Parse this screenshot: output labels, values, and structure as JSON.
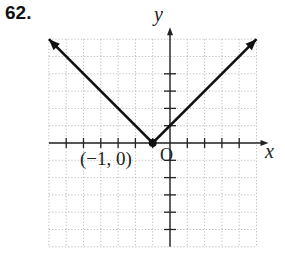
{
  "problem_number": "62.",
  "chart_data": {
    "type": "line",
    "title": "",
    "function_description": "y = |x + 1|",
    "xlabel": "x",
    "ylabel": "y",
    "origin_label": "O",
    "xlim": [
      -7,
      5
    ],
    "ylim": [
      -6,
      6
    ],
    "grid": true,
    "grid_style": "dotted",
    "series": [
      {
        "name": "absolute value graph",
        "points": [
          [
            -7,
            6
          ],
          [
            -1,
            0
          ],
          [
            5,
            6
          ]
        ],
        "arrows_at_ends": true
      }
    ],
    "annotations": [
      {
        "text": "(−1, 0)",
        "x": -1,
        "y": 0,
        "marker": "filled-circle"
      }
    ],
    "x_ticks": [
      -6,
      -5,
      -4,
      -3,
      -2,
      -1,
      1,
      2,
      3,
      4
    ],
    "y_ticks": [
      -5,
      -4,
      -3,
      -2,
      -1,
      1,
      2,
      3,
      4
    ]
  },
  "labels": {
    "x_axis": "x",
    "y_axis": "y",
    "origin": "O",
    "vertex": "(−1, 0)"
  }
}
